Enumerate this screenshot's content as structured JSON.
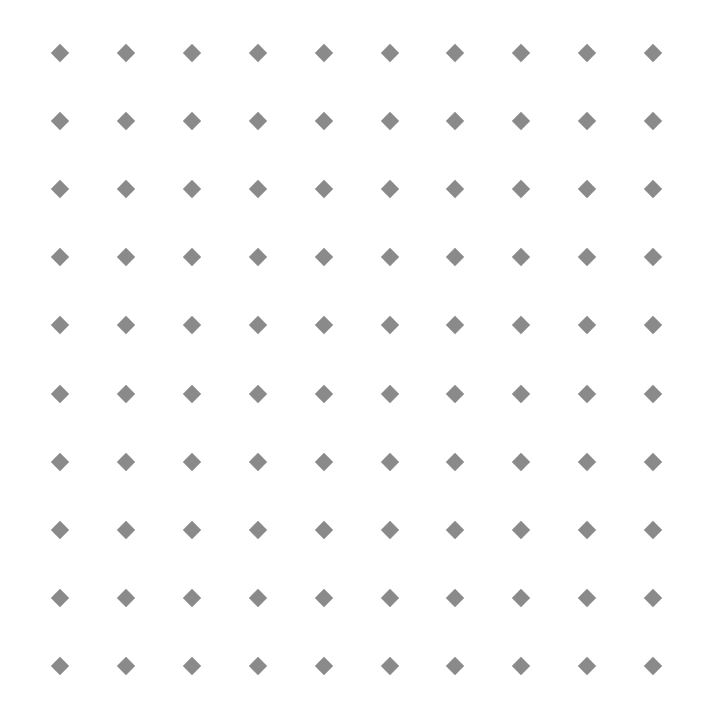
{
  "pattern": {
    "shape": "diamond",
    "color": "#8a8a8a",
    "background": "#ffffff",
    "rows": 10,
    "cols": 10,
    "origin_x": 60,
    "origin_y": 53,
    "step_x": 65.9,
    "step_y": 68.1,
    "size": 13
  }
}
